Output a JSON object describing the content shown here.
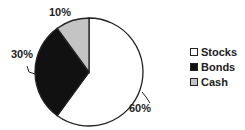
{
  "chart_data": {
    "type": "pie",
    "title": "",
    "slices": [
      {
        "label": "Stocks",
        "value": 60,
        "display": "60%",
        "color": "#ffffff"
      },
      {
        "label": "Bonds",
        "value": 30,
        "display": "30%",
        "color": "#111111"
      },
      {
        "label": "Cash",
        "value": 10,
        "display": "10%",
        "color": "#c4c4c4"
      }
    ],
    "start": "12 o'clock",
    "direction": "clockwise",
    "legend_position": "right"
  }
}
